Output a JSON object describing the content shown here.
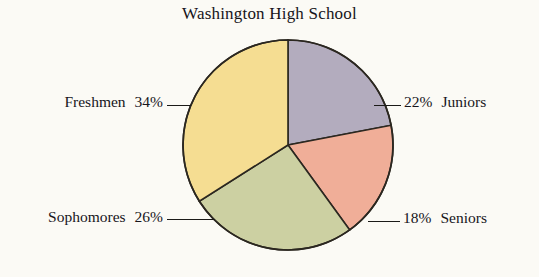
{
  "chart_data": {
    "type": "pie",
    "title": "Washington High School",
    "categories": [
      "Juniors",
      "Seniors",
      "Sophomores",
      "Freshmen"
    ],
    "values": [
      22,
      18,
      26,
      34
    ],
    "value_labels": [
      "22%",
      "18%",
      "26%",
      "34%"
    ],
    "unit": "percent",
    "total": 100,
    "start_angle_deg": 0,
    "direction": "clockwise",
    "legend": "none",
    "grid": false,
    "slices": [
      {
        "label": "Juniors",
        "value": 22,
        "value_label": "22%",
        "color": "#b3acbe",
        "label_side": "right",
        "label_text": "22%   Juniors"
      },
      {
        "label": "Seniors",
        "value": 18,
        "value_label": "18%",
        "color": "#f0ae98",
        "label_side": "right",
        "label_text": "18%   Seniors"
      },
      {
        "label": "Sophomores",
        "value": 26,
        "value_label": "26%",
        "color": "#ccd0a2",
        "label_side": "left",
        "label_text": "Sophomores   26%"
      },
      {
        "label": "Freshmen",
        "value": 34,
        "value_label": "34%",
        "color": "#f5dd92",
        "label_side": "left",
        "label_text": "Freshmen   34%"
      }
    ],
    "stroke_color": "#2b2720",
    "background_color": "#fbfaf5"
  },
  "title": {
    "text": "Washington High School"
  },
  "callouts": {
    "freshmen": {
      "percent": "34%",
      "name": "Freshmen"
    },
    "sophomores": {
      "percent": "26%",
      "name": "Sophomores"
    },
    "juniors": {
      "percent": "22%",
      "name": "Juniors"
    },
    "seniors": {
      "percent": "18%",
      "name": "Seniors"
    }
  }
}
